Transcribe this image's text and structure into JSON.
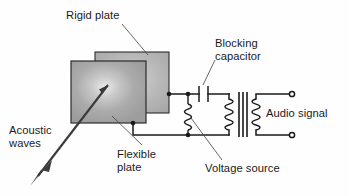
{
  "figure": {
    "background_color": "#fefefe",
    "line_color": "#1a1a1a",
    "plate_fill": "#a8a8a8",
    "plate_highlight": "#ebebeb",
    "text_color": "#1a1a1a"
  },
  "labels": {
    "rigid_plate": "Rigid plate",
    "blocking_capacitor_line1": "Blocking",
    "blocking_capacitor_line2": "capacitor",
    "audio_signal": "Audio signal",
    "acoustic_waves_line1": "Acoustic",
    "acoustic_waves_line2": "waves",
    "flexible_plate_line1": "Flexible",
    "flexible_plate_line2": "plate",
    "voltage_source": "Voltage source"
  },
  "components": {
    "rigid_plate": "rear-plate",
    "flexible_plate": "front-plate",
    "capacitor": "capacitor-symbol",
    "voltage_source": "coil-symbol",
    "transformer": "transformer-symbol",
    "output_terminal_top": "terminal-node",
    "output_terminal_bottom": "terminal-node",
    "acoustic_arrow": "double-headed-arrow",
    "pointer_arrow": "solid-arrow"
  }
}
